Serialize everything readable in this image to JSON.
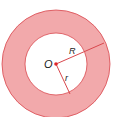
{
  "diagram": {
    "type": "annulus",
    "center_label": "O",
    "outer_radius_label": "R",
    "inner_radius_label": "r",
    "colors": {
      "ring_fill": "#f2a9ab",
      "ring_stroke": "#d9484e",
      "center_dot": "#e0262c",
      "inner_fill": "#ffffff"
    }
  }
}
